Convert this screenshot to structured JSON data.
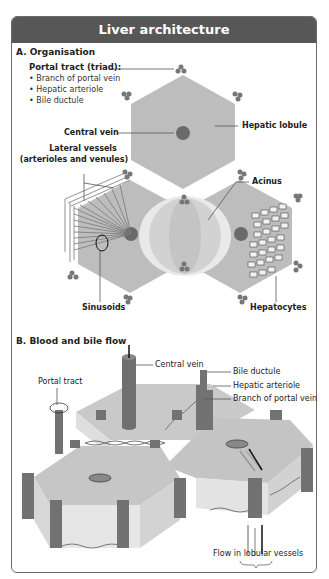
{
  "header": {
    "title": "Liver architecture"
  },
  "section_a": {
    "title": "A. Organisation",
    "portal_tract": {
      "label": "Portal tract (triad):",
      "items": [
        "Branch of portal vein",
        "Hepatic arteriole",
        "Bile ductule"
      ]
    },
    "labels": {
      "central_vein": "Central vein",
      "hepatic_lobule": "Hepatic lobule",
      "lateral_vessels_1": "Lateral vessels",
      "lateral_vessels_2": "(arterioles and venules)",
      "acinus": "Acinus",
      "sinusoids": "Sinusoids",
      "hepatocytes": "Hepatocytes"
    }
  },
  "section_b": {
    "title": "B. Blood and bile flow",
    "labels": {
      "central_vein": "Central vein",
      "portal_tract": "Portal tract",
      "bile_ductule": "Bile ductule",
      "hepatic_arteriole": "Hepatic arteriole",
      "branch_portal_vein": "Branch of portal vein",
      "flow": "Flow in lobular vessels"
    }
  },
  "colors": {
    "header_bg": "#575757",
    "lobule": "#bdbdbd",
    "vessel": "#6e6e6e",
    "acinus": "#e8e8e8"
  }
}
